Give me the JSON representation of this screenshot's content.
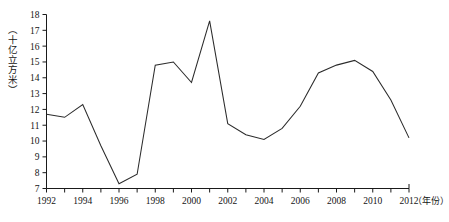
{
  "chart_data": {
    "type": "line",
    "title": "",
    "subtitle": "",
    "xlabel": "（年份）",
    "ylabel": "（十亿立方米）",
    "xlim": [
      1992,
      2012
    ],
    "ylim": [
      7,
      18
    ],
    "grid": false,
    "legend": null,
    "legend_position": "none",
    "line_color": "#2b2b2b",
    "x": [
      1992,
      1993,
      1994,
      1995,
      1996,
      1997,
      1998,
      1999,
      2000,
      2001,
      2002,
      2003,
      2004,
      2005,
      2006,
      2007,
      2008,
      2009,
      2010,
      2011,
      2012
    ],
    "values": [
      11.7,
      11.5,
      12.3,
      9.7,
      7.3,
      7.9,
      14.8,
      15.0,
      13.7,
      17.6,
      11.1,
      10.4,
      10.1,
      10.8,
      12.2,
      14.3,
      14.8,
      15.1,
      14.4,
      12.6,
      10.2
    ],
    "series": [
      {
        "name": "",
        "values": [
          11.7,
          11.5,
          12.3,
          9.7,
          7.3,
          7.9,
          14.8,
          15.0,
          13.7,
          17.6,
          11.1,
          10.4,
          10.1,
          10.8,
          12.2,
          14.3,
          14.8,
          15.1,
          14.4,
          12.6,
          10.2
        ]
      }
    ],
    "y_ticks": [
      7,
      8,
      9,
      10,
      11,
      12,
      13,
      14,
      15,
      16,
      17,
      18
    ],
    "y_tick_labels": [
      "7",
      "8",
      "9",
      "10",
      "11",
      "12",
      "13",
      "14",
      "15",
      "16",
      "17",
      "18"
    ],
    "x_ticks": [
      1992,
      1993,
      1994,
      1995,
      1996,
      1997,
      1998,
      1999,
      2000,
      2001,
      2002,
      2003,
      2004,
      2005,
      2006,
      2007,
      2008,
      2009,
      2010,
      2011,
      2012
    ],
    "x_tick_labels_shown": [
      "1992",
      "1994",
      "1996",
      "1998",
      "2000",
      "2002",
      "2004",
      "2006",
      "2008",
      "2010",
      "2012"
    ],
    "x_labeled_values": [
      1992,
      1994,
      1996,
      1998,
      2000,
      2002,
      2004,
      2006,
      2008,
      2010,
      2012
    ]
  }
}
